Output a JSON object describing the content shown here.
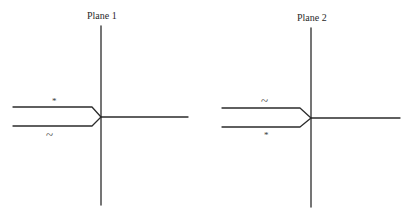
{
  "planes": [
    {
      "title": "Plane 1",
      "upper_label": "*",
      "lower_label": "~"
    },
    {
      "title": "Plane 2",
      "upper_label": "~",
      "lower_label": "*"
    }
  ],
  "colors": {
    "line": "#2b2b2b",
    "background": "#ffffff"
  }
}
